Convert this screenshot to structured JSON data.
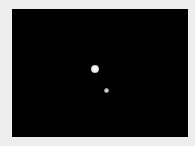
{
  "image": {
    "description": "Dark night-sky photograph with a bright primary body and a smaller, dimmer companion",
    "background_color": "#000000",
    "border_color": "#eeeeee",
    "objects": [
      {
        "name": "primary-body",
        "x": 95,
        "y": 69,
        "diameter": 8,
        "color": "#ffffff"
      },
      {
        "name": "companion-body",
        "x": 106,
        "y": 90,
        "diameter": 5,
        "color": "#c0c0c0"
      }
    ]
  }
}
